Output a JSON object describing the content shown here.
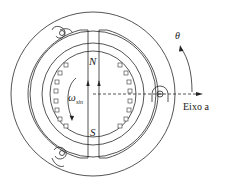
{
  "diagram": {
    "type": "synchronous-machine-cross-section",
    "labels": {
      "north_pole": "N",
      "south_pole": "S",
      "omega": "ω",
      "omega_sub": "sin",
      "theta": "θ",
      "axis": "Eixo a"
    },
    "colors": {
      "stroke": "#2a2a2a",
      "background": "#ffffff"
    },
    "geometry": {
      "center": [
        93,
        94
      ],
      "outer_radius": 82,
      "stator_inner_radius": 63,
      "airgap_radius": 51,
      "rotor_radius": 43,
      "rotor_slots_per_side": 8
    }
  }
}
